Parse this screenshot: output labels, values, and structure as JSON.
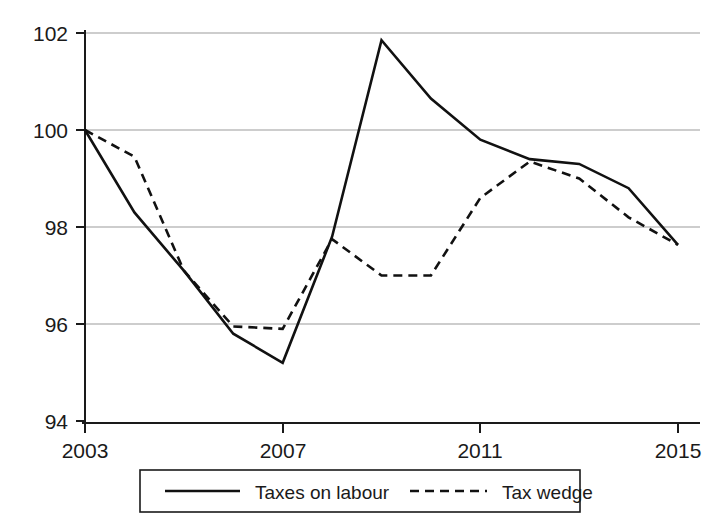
{
  "chart_data": {
    "type": "line",
    "title": "",
    "subtitle": "",
    "xlabel": "",
    "ylabel": "",
    "x": [
      2003,
      2004,
      2005,
      2006,
      2007,
      2008,
      2009,
      2010,
      2011,
      2012,
      2013,
      2014,
      2015
    ],
    "xlim": [
      2003,
      2015
    ],
    "ylim": [
      94,
      102
    ],
    "xticks": [
      2003,
      2007,
      2011,
      2015
    ],
    "xtick_labels": [
      "2003",
      "2007",
      "2011",
      "2015"
    ],
    "yticks": [
      94,
      96,
      98,
      100,
      102
    ],
    "ytick_labels": [
      "94",
      "96",
      "98",
      "100",
      "102"
    ],
    "grid": "horizontal",
    "legend_position": "bottom-center",
    "series": [
      {
        "name": "Taxes on labour",
        "style": "solid",
        "color": "#111111",
        "values": [
          100,
          98.3,
          97.1,
          95.8,
          95.2,
          97.8,
          101.85,
          100.65,
          99.8,
          99.4,
          99.3,
          98.8,
          97.63
        ]
      },
      {
        "name": "Tax wedge",
        "style": "dashed",
        "color": "#111111",
        "values": [
          100,
          99.45,
          97.1,
          95.95,
          95.9,
          97.75,
          97.0,
          97.0,
          98.6,
          99.35,
          99.0,
          98.2,
          97.63
        ]
      }
    ]
  },
  "legend": {
    "items": [
      {
        "label": "Taxes on labour",
        "style": "solid"
      },
      {
        "label": "Tax wedge",
        "style": "dashed"
      }
    ]
  },
  "axes": {
    "y_labels": [
      "102",
      "100",
      "98",
      "96",
      "94"
    ],
    "x_labels": [
      "2003",
      "2007",
      "2011",
      "2015"
    ]
  }
}
